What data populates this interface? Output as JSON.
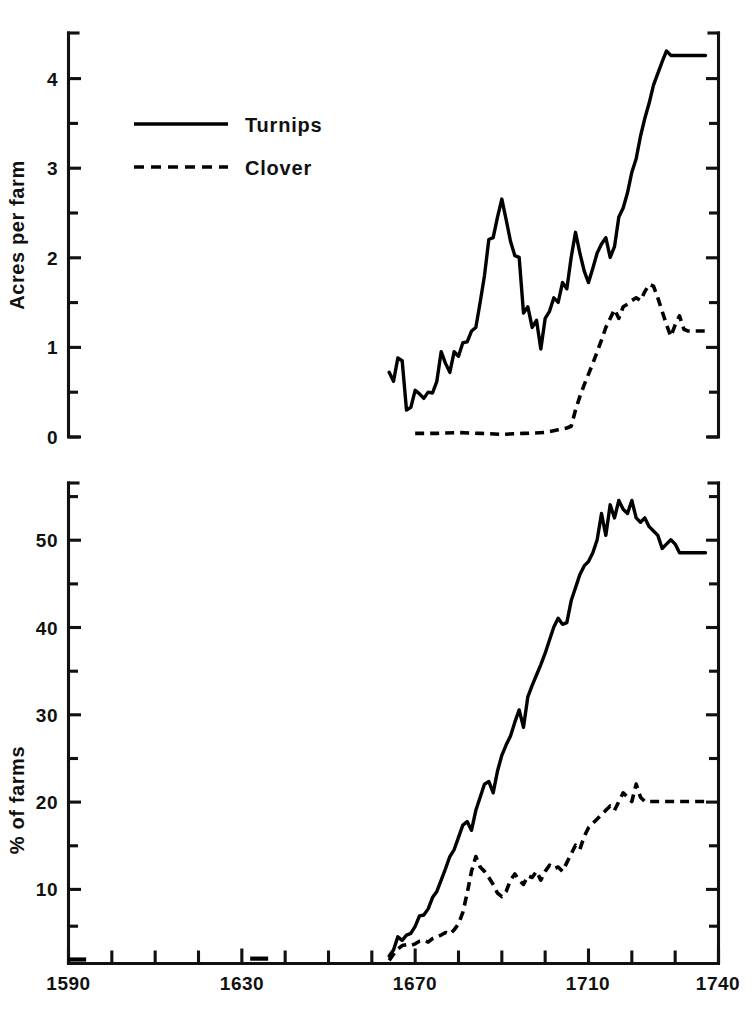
{
  "figure": {
    "name": "turnips-clover-diffusion-figure",
    "background": "#ffffff",
    "ink": "#000000"
  },
  "legend": {
    "position": "top-left of upper panel",
    "entries": [
      {
        "label": "Turnips",
        "style": "solid"
      },
      {
        "label": "Clover",
        "style": "dashed"
      }
    ]
  },
  "xaxis": {
    "label": "",
    "min": 1590,
    "max": 1740,
    "tick_labels": [
      "1590",
      "1630",
      "1670",
      "1710",
      "1740"
    ],
    "tick_values": [
      1590,
      1630,
      1670,
      1710,
      1740
    ],
    "minor_tick_step": 10
  },
  "panels": [
    {
      "id": "acres-panel",
      "ylabel": "Acres per farm",
      "ymin": 0,
      "ymax": 4.5,
      "tick_labels": [
        "0",
        "1",
        "2",
        "3",
        "4"
      ],
      "tick_values": [
        0,
        1,
        2,
        3,
        4
      ],
      "minor_tick_values": [
        0.5,
        1.5,
        2.5,
        3.5,
        4.5
      ]
    },
    {
      "id": "percent-panel",
      "ylabel": "% of farms",
      "ymin": 0,
      "ymax": 55,
      "tick_labels": [
        "10",
        "20",
        "30",
        "40",
        "50"
      ],
      "tick_values": [
        10,
        20,
        30,
        40,
        50
      ],
      "minor_tick_values": [
        5,
        15,
        25,
        35,
        45,
        55
      ]
    }
  ],
  "chart_data": [
    {
      "type": "line",
      "id": "acres-per-farm",
      "title": "",
      "xlabel": "",
      "ylabel": "Acres per farm",
      "xlim": [
        1590,
        1740
      ],
      "ylim": [
        0,
        4.5
      ],
      "grid": false,
      "legend_position": "upper left",
      "series": [
        {
          "name": "Turnips",
          "style": "solid",
          "x": [
            1664,
            1665,
            1666,
            1667,
            1668,
            1669,
            1670,
            1671,
            1672,
            1673,
            1674,
            1675,
            1676,
            1677,
            1678,
            1679,
            1680,
            1681,
            1682,
            1683,
            1684,
            1685,
            1686,
            1687,
            1688,
            1689,
            1690,
            1691,
            1692,
            1693,
            1694,
            1695,
            1696,
            1697,
            1698,
            1699,
            1700,
            1701,
            1702,
            1703,
            1704,
            1705,
            1706,
            1707,
            1708,
            1709,
            1710,
            1711,
            1712,
            1713,
            1714,
            1715,
            1716,
            1717,
            1718,
            1719,
            1720,
            1721,
            1722,
            1723,
            1724,
            1725,
            1726,
            1727,
            1728,
            1729,
            1730,
            1731,
            1732,
            1733,
            1734,
            1735,
            1736,
            1737
          ],
          "y": [
            0.72,
            0.62,
            0.88,
            0.85,
            0.3,
            0.33,
            0.52,
            0.48,
            0.43,
            0.5,
            0.49,
            0.62,
            0.95,
            0.82,
            0.72,
            0.95,
            0.9,
            1.05,
            1.06,
            1.18,
            1.22,
            1.5,
            1.8,
            2.2,
            2.22,
            2.45,
            2.65,
            2.42,
            2.18,
            2.02,
            2.0,
            1.38,
            1.45,
            1.22,
            1.3,
            0.98,
            1.32,
            1.4,
            1.55,
            1.5,
            1.72,
            1.65,
            2.0,
            2.28,
            2.05,
            1.85,
            1.72,
            1.88,
            2.05,
            2.15,
            2.22,
            2.0,
            2.12,
            2.45,
            2.55,
            2.72,
            2.95,
            3.1,
            3.35,
            3.55,
            3.72,
            3.92,
            4.05,
            4.18,
            4.3,
            4.25,
            4.25,
            4.25,
            4.25,
            4.25,
            4.25,
            4.25,
            4.25,
            4.25
          ]
        },
        {
          "name": "Clover",
          "style": "dashed",
          "x": [
            1670,
            1675,
            1680,
            1685,
            1690,
            1695,
            1700,
            1703,
            1705,
            1706,
            1707,
            1708,
            1709,
            1710,
            1711,
            1712,
            1713,
            1714,
            1715,
            1716,
            1717,
            1718,
            1719,
            1720,
            1721,
            1722,
            1723,
            1724,
            1725,
            1726,
            1727,
            1728,
            1729,
            1730,
            1731,
            1732,
            1733,
            1734,
            1735,
            1736,
            1737
          ],
          "y": [
            0.04,
            0.04,
            0.05,
            0.04,
            0.03,
            0.04,
            0.05,
            0.08,
            0.1,
            0.12,
            0.3,
            0.45,
            0.58,
            0.7,
            0.82,
            0.95,
            1.08,
            1.22,
            1.32,
            1.42,
            1.32,
            1.45,
            1.48,
            1.52,
            1.55,
            1.52,
            1.62,
            1.7,
            1.68,
            1.55,
            1.4,
            1.25,
            1.12,
            1.25,
            1.35,
            1.2,
            1.18,
            1.18,
            1.18,
            1.18,
            1.18
          ]
        }
      ]
    },
    {
      "type": "line",
      "id": "percent-of-farms",
      "title": "",
      "xlabel": "",
      "ylabel": "% of farms",
      "xlim": [
        1590,
        1740
      ],
      "ylim": [
        0,
        55
      ],
      "grid": false,
      "legend_position": "shared with upper panel",
      "series": [
        {
          "name": "Turnips",
          "style": "solid",
          "x": [
            1664,
            1665,
            1666,
            1667,
            1668,
            1669,
            1670,
            1671,
            1672,
            1673,
            1674,
            1675,
            1676,
            1677,
            1678,
            1679,
            1680,
            1681,
            1682,
            1683,
            1684,
            1685,
            1686,
            1687,
            1688,
            1689,
            1690,
            1691,
            1692,
            1693,
            1694,
            1695,
            1696,
            1697,
            1698,
            1699,
            1700,
            1701,
            1702,
            1703,
            1704,
            1705,
            1706,
            1707,
            1708,
            1709,
            1710,
            1711,
            1712,
            1713,
            1714,
            1715,
            1716,
            1717,
            1718,
            1719,
            1720,
            1721,
            1722,
            1723,
            1724,
            1725,
            1726,
            1727,
            1728,
            1729,
            1730,
            1731,
            1732,
            1733,
            1734,
            1735,
            1736,
            1737
          ],
          "y": [
            0.8,
            1.5,
            3.0,
            2.6,
            3.2,
            3.4,
            4.2,
            5.4,
            5.5,
            6.2,
            7.5,
            8.2,
            9.5,
            10.8,
            12.2,
            13.0,
            14.4,
            15.8,
            16.2,
            15.2,
            17.5,
            19.0,
            20.5,
            20.8,
            19.5,
            22.0,
            23.8,
            25.0,
            26.0,
            27.6,
            29.0,
            27.0,
            30.5,
            31.8,
            33.0,
            34.2,
            35.5,
            37.0,
            38.5,
            39.5,
            38.8,
            39.0,
            41.5,
            43.0,
            44.5,
            45.5,
            46.0,
            47.0,
            48.5,
            51.5,
            49.0,
            52.5,
            51.0,
            53.0,
            52.0,
            51.5,
            53.0,
            51.0,
            50.5,
            51.0,
            50.0,
            49.5,
            49.0,
            47.5,
            48.0,
            48.5,
            48.0,
            47.0,
            47.0,
            47.0,
            47.0,
            47.0,
            47.0,
            47.0
          ]
        },
        {
          "name": "Clover",
          "style": "dashed",
          "x": [
            1664,
            1665,
            1666,
            1667,
            1668,
            1669,
            1670,
            1671,
            1672,
            1673,
            1674,
            1675,
            1676,
            1677,
            1678,
            1679,
            1680,
            1681,
            1682,
            1683,
            1684,
            1685,
            1686,
            1687,
            1688,
            1689,
            1690,
            1691,
            1692,
            1693,
            1694,
            1695,
            1696,
            1697,
            1698,
            1699,
            1700,
            1701,
            1702,
            1703,
            1704,
            1705,
            1706,
            1707,
            1708,
            1709,
            1710,
            1711,
            1712,
            1713,
            1714,
            1715,
            1716,
            1717,
            1718,
            1719,
            1720,
            1721,
            1722,
            1723,
            1724,
            1725,
            1726,
            1727,
            1728,
            1729,
            1730,
            1731,
            1732,
            1733,
            1734,
            1735,
            1736,
            1737
          ],
          "y": [
            0.3,
            1.0,
            1.6,
            2.0,
            2.1,
            2.0,
            2.2,
            2.5,
            2.6,
            2.4,
            2.8,
            3.0,
            3.2,
            3.5,
            3.3,
            3.8,
            4.5,
            5.8,
            8.0,
            10.5,
            12.2,
            11.0,
            10.5,
            9.8,
            9.0,
            8.0,
            7.6,
            8.2,
            9.5,
            10.2,
            9.5,
            9.0,
            10.0,
            9.8,
            10.5,
            9.5,
            10.5,
            11.2,
            10.8,
            11.0,
            10.5,
            11.5,
            12.5,
            13.5,
            13.0,
            14.5,
            15.5,
            16.0,
            16.5,
            17.0,
            17.5,
            18.0,
            17.5,
            18.5,
            19.5,
            19.0,
            18.5,
            20.5,
            19.0,
            18.5,
            18.5,
            18.5,
            18.5,
            18.5,
            18.5,
            18.5,
            18.5,
            18.5,
            18.5,
            18.5,
            18.5,
            18.5,
            18.5,
            18.5
          ]
        }
      ],
      "isolated_marks": [
        {
          "x": 1592,
          "y": 0.4,
          "note": "single observation stub near baseline"
        },
        {
          "x": 1634,
          "y": 0.5,
          "note": "single observation stub near baseline"
        }
      ]
    }
  ]
}
